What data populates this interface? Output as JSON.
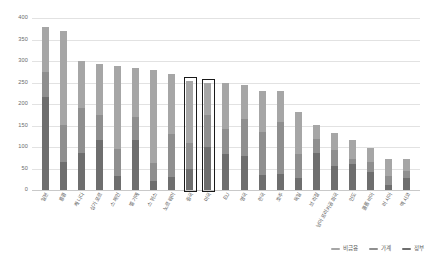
{
  "chart_data": {
    "type": "bar",
    "title": "",
    "subtitle": "",
    "xlabel": "",
    "ylabel": "",
    "ylim": [
      0,
      400
    ],
    "ytick_values": [
      400,
      350,
      300,
      250,
      200,
      150,
      100,
      50,
      0
    ],
    "ytick_labels": [
      "400",
      "350",
      "300",
      "250",
      "200",
      "150",
      "100",
      "50",
      "0"
    ],
    "grid": true,
    "stacked": true,
    "legend_position": "bottom-right",
    "categories": [
      "일본",
      "홍콩",
      "캐나다",
      "싱가포르",
      "스페인",
      "벨기에",
      "스위스",
      "노르웨이",
      "중국",
      "미국",
      "EU",
      "영국",
      "한국",
      "호주",
      "독일",
      "브라질",
      "남아프리카공화국",
      "인도",
      "콜롬비아",
      "러시아",
      "멕시코"
    ],
    "series": [
      {
        "name": "정부",
        "color": "#6e6e6e",
        "values": [
          217,
          64,
          86,
          117,
          32,
          117,
          22,
          31,
          48,
          99,
          83,
          80,
          36,
          37,
          28,
          85,
          56,
          60,
          41,
          11,
          29
        ]
      },
      {
        "name": "가계",
        "color": "#8f8f8f",
        "values": [
          58,
          88,
          105,
          57,
          63,
          52,
          40,
          100,
          62,
          76,
          58,
          85,
          98,
          122,
          55,
          34,
          36,
          12,
          25,
          21,
          16
        ]
      },
      {
        "name": "비금융",
        "color": "#a6a6a6",
        "values": [
          105,
          218,
          110,
          118,
          193,
          115,
          216,
          139,
          144,
          75,
          107,
          80,
          97,
          71,
          98,
          32,
          40,
          44,
          32,
          40,
          26
        ]
      }
    ],
    "totals": [
      380,
      370,
      301,
      292,
      288,
      284,
      278,
      270,
      254,
      250,
      248,
      245,
      231,
      230,
      181,
      151,
      132,
      116,
      98,
      72,
      71
    ],
    "highlighted_categories": [
      "중국",
      "미국"
    ],
    "annotations": [
      {
        "name": "china-highlight-box",
        "category": "중국",
        "style": "thin-black-rectangle"
      },
      {
        "name": "usa-highlight-box",
        "category": "미국",
        "style": "thick-black-rectangle"
      }
    ]
  },
  "legend": {
    "items": [
      {
        "label": "비금융",
        "color": "#a6a6a6"
      },
      {
        "label": "가계",
        "color": "#8f8f8f"
      },
      {
        "label": "정부",
        "color": "#6e6e6e"
      }
    ]
  },
  "colors": {
    "background": "#ffffff",
    "gridline": "#e2e2e2",
    "axis": "#c9c9c9",
    "tick_text": "#6b6b6b",
    "label_text": "#595959",
    "highlight_border": "#1a1a1a"
  }
}
